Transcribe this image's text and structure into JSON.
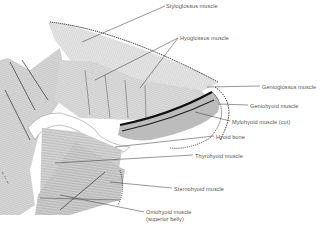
{
  "figure": {
    "background": "#ffffff",
    "ink_color": "#3a3a3a",
    "labels": [
      {
        "id": "styloglossus",
        "text": "Styloglossus muscle",
        "x": 166,
        "y": 3
      },
      {
        "id": "hyoglossus",
        "text": "Hyoglossus muscle",
        "x": 180,
        "y": 35
      },
      {
        "id": "genioglossus",
        "text": "Genioglossus muscle",
        "x": 262,
        "y": 84
      },
      {
        "id": "geniohyoid",
        "text": "Geniohyoid muscle",
        "x": 250,
        "y": 103
      },
      {
        "id": "mylohyoid",
        "text": "Mylohyoid muscle (cut)",
        "x": 232,
        "y": 119
      },
      {
        "id": "hyoid-bone",
        "text": "Hyoid bone",
        "x": 216,
        "y": 134
      },
      {
        "id": "thyrohyoid",
        "text": "Thyrohyoid muscle",
        "x": 195,
        "y": 153
      },
      {
        "id": "sternohyoid",
        "text": "Sternohyoid muscle",
        "x": 174,
        "y": 186
      },
      {
        "id": "omohyoid",
        "text": "Omohyoid muscle",
        "x": 146,
        "y": 210
      },
      {
        "id": "omohyoid-sub",
        "text": "(superior belly)",
        "x": 146,
        "y": 216.5
      }
    ],
    "signature": "illegible artist signature"
  }
}
